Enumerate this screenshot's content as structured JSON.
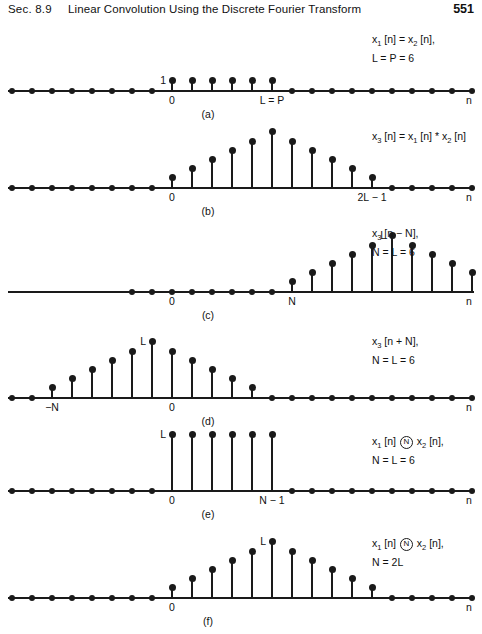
{
  "header": {
    "section": "Sec. 8.9",
    "title": "Linear Convolution Using the Discrete Fourier Transform",
    "page": "551"
  },
  "axis_n_label": "n",
  "chart_data": [
    {
      "type": "stem",
      "id": "a",
      "caption": "(a)",
      "annotation_lines": [
        "x1 [n] = x2 [n],",
        "L = P = 6"
      ],
      "peak_label": "1",
      "xlabels": [
        {
          "n": 0,
          "text": "0"
        },
        {
          "n": 5,
          "text": "L = P"
        }
      ],
      "x": [
        0,
        1,
        2,
        3,
        4,
        5
      ],
      "values": [
        1,
        1,
        1,
        1,
        1,
        1
      ],
      "ymax": 6,
      "zeros_left": 8,
      "zeros_right": 12,
      "xlabel": "n"
    },
    {
      "type": "stem",
      "id": "b",
      "caption": "(b)",
      "annotation_lines": [
        "x3 [n] = x1 [n] * x2 [n]"
      ],
      "peak_label": "",
      "xlabels": [
        {
          "n": 0,
          "text": "0"
        },
        {
          "n": 10,
          "text": "2L − 1"
        }
      ],
      "x": [
        0,
        1,
        2,
        3,
        4,
        5,
        6,
        7,
        8,
        9,
        10
      ],
      "values": [
        1,
        2,
        3,
        4,
        5,
        6,
        5,
        4,
        3,
        2,
        1
      ],
      "ymax": 6,
      "zeros_left": 8,
      "zeros_right": 7,
      "xlabel": "n"
    },
    {
      "type": "stem",
      "id": "c",
      "caption": "(c)",
      "annotation_lines": [
        "x3 [n − N],",
        "N = L = 6"
      ],
      "peak_label": "L",
      "xlabels": [
        {
          "n": 0,
          "text": "0"
        },
        {
          "n": 6,
          "text": "N"
        }
      ],
      "x": [
        6,
        7,
        8,
        9,
        10,
        11,
        12,
        13,
        14,
        15,
        16
      ],
      "values": [
        1,
        2,
        3,
        4,
        5,
        6,
        5,
        4,
        3,
        2,
        1
      ],
      "ymax": 6,
      "zeros_left": 8,
      "zeros_right": 1,
      "xlabel": "n"
    },
    {
      "type": "stem",
      "id": "d",
      "caption": "(d)",
      "annotation_lines": [
        "x3 [n + N],",
        "N = L = 6"
      ],
      "peak_label": "L",
      "xlabels": [
        {
          "n": -6,
          "text": "−N"
        },
        {
          "n": 0,
          "text": "0"
        }
      ],
      "x": [
        -6,
        -5,
        -4,
        -3,
        -2,
        -1,
        0,
        1,
        2,
        3,
        4
      ],
      "values": [
        1,
        2,
        3,
        4,
        5,
        6,
        5,
        4,
        3,
        2,
        1
      ],
      "ymax": 6,
      "zeros_left": 2,
      "zeros_right": 13,
      "xlabel": "n"
    },
    {
      "type": "stem",
      "id": "e",
      "caption": "(e)",
      "annotation_lines": [
        "x1 [n] (N) x2 [n],",
        "N = L = 6"
      ],
      "peak_label": "L",
      "xlabels": [
        {
          "n": 0,
          "text": "0"
        },
        {
          "n": 5,
          "text": "N − 1"
        }
      ],
      "x": [
        0,
        1,
        2,
        3,
        4,
        5
      ],
      "values": [
        6,
        6,
        6,
        6,
        6,
        6
      ],
      "ymax": 6,
      "zeros_left": 8,
      "zeros_right": 12,
      "xlabel": "n"
    },
    {
      "type": "stem",
      "id": "f",
      "caption": "(f)",
      "annotation_lines": [
        "x1 [n] (N) x2 [n],",
        "N = 2L"
      ],
      "peak_label": "L",
      "xlabels": [
        {
          "n": 0,
          "text": "0"
        }
      ],
      "x": [
        0,
        1,
        2,
        3,
        4,
        5,
        6,
        7,
        8,
        9,
        10
      ],
      "values": [
        1,
        2,
        3,
        4,
        5,
        6,
        5,
        4,
        3,
        2,
        1
      ],
      "ymax": 6,
      "zeros_left": 8,
      "zeros_right": 7,
      "xlabel": "n"
    }
  ]
}
